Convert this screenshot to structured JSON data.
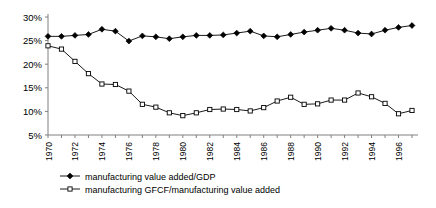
{
  "chart_data": {
    "type": "line",
    "title": "",
    "subtitle": "",
    "xlabel": "",
    "ylabel": "",
    "grid": false,
    "legend_position": "bottom-left",
    "xlim": [
      1970,
      1997
    ],
    "ylim": [
      5,
      30
    ],
    "y_tick_labels": [
      "30%",
      "25%",
      "20%",
      "15%",
      "10%",
      "5%"
    ],
    "y_ticks": [
      30,
      25,
      20,
      15,
      10,
      5
    ],
    "y_unit": "%",
    "x": [
      1970,
      1971,
      1972,
      1973,
      1974,
      1975,
      1976,
      1977,
      1978,
      1979,
      1980,
      1981,
      1982,
      1983,
      1984,
      1985,
      1986,
      1987,
      1988,
      1989,
      1990,
      1991,
      1992,
      1993,
      1994,
      1995,
      1996,
      1997
    ],
    "x_tick_labels": [
      "1970",
      "1972",
      "1974",
      "1976",
      "1978",
      "1980",
      "1982",
      "1984",
      "1986",
      "1988",
      "1990",
      "1992",
      "1994",
      "1996"
    ],
    "x_label_interval": 2,
    "series": [
      {
        "name": "manufacturing value added/GDP",
        "marker": "filled-diamond",
        "color": "#000000",
        "values": [
          25.9,
          25.9,
          26.1,
          26.3,
          27.4,
          27.0,
          24.9,
          26.0,
          25.8,
          25.4,
          25.8,
          26.1,
          26.1,
          26.2,
          26.6,
          27.0,
          26.0,
          25.8,
          26.3,
          26.8,
          27.2,
          27.6,
          27.2,
          26.6,
          26.4,
          27.2,
          27.8,
          28.2
        ]
      },
      {
        "name": "manufacturing GFCF/manufacturing value added",
        "marker": "open-square",
        "color": "#000000",
        "values": [
          23.9,
          23.2,
          20.6,
          18.0,
          15.8,
          15.7,
          14.3,
          11.5,
          10.9,
          9.7,
          9.1,
          9.7,
          10.4,
          10.5,
          10.4,
          10.1,
          10.8,
          12.2,
          13.0,
          11.5,
          11.6,
          12.4,
          12.4,
          13.9,
          13.1,
          11.7,
          9.5,
          10.2
        ]
      }
    ]
  },
  "legend": {
    "items": [
      {
        "label": "manufacturing value added/GDP",
        "marker": "filled-diamond"
      },
      {
        "label": "manufacturing GFCF/manufacturing value added",
        "marker": "open-square"
      }
    ]
  }
}
